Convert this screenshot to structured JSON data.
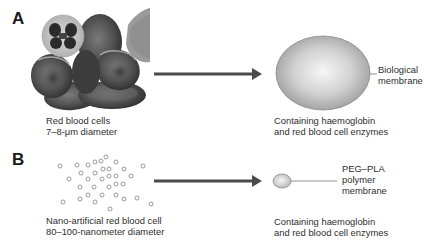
{
  "panel_a": {
    "label": "A",
    "source": {
      "image": "red-blood-cells-micrograph",
      "caption_line1": "Red blood cells",
      "caption_line2": "7–8-μm diameter"
    },
    "target": {
      "shape": "large-oval-cell",
      "membrane_label_line1": "Biological",
      "membrane_label_line2": "membrane",
      "caption_line1": "Containing haemoglobin",
      "caption_line2": "and red blood cell enzymes"
    }
  },
  "panel_b": {
    "label": "B",
    "source": {
      "image": "nano-particle-scatter",
      "caption_line1": "Nano-artificial red blood cell",
      "caption_line2": "80–100-nanometer diameter"
    },
    "target": {
      "shape": "small-oval-particle",
      "membrane_label_line1": "PEG–PLA",
      "membrane_label_line2": "polymer",
      "membrane_label_line3": "membrane",
      "caption_line1": "Containing haemoglobin",
      "caption_line2": "and red blood cell enzymes"
    }
  },
  "colors": {
    "arrow": "#4a4a4a",
    "cell_fill_center": "#f2f2f2",
    "cell_fill_edge": "#a8a8a8",
    "cell_outline": "#8a8a8a",
    "rbc_dark": "#3c3c3c",
    "particle_outline": "#8f8f8f"
  }
}
